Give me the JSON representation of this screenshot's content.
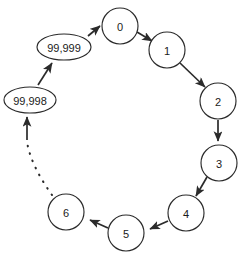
{
  "diagram": {
    "type": "ring-graph",
    "background_color": "#ffffff",
    "stroke_color": "#2b2b2b",
    "fill_color": "#ffffff",
    "nodes": [
      {
        "id": "n0",
        "label": "0",
        "shape": "circle",
        "cx": 120,
        "cy": 26,
        "r": 18
      },
      {
        "id": "n1",
        "label": "1",
        "shape": "circle",
        "cx": 167,
        "cy": 50,
        "r": 18
      },
      {
        "id": "n2",
        "label": "2",
        "shape": "circle",
        "cx": 218,
        "cy": 101,
        "r": 18
      },
      {
        "id": "n3",
        "label": "3",
        "shape": "circle",
        "cx": 219,
        "cy": 163,
        "r": 18
      },
      {
        "id": "n4",
        "label": "4",
        "shape": "circle",
        "cx": 186,
        "cy": 213,
        "r": 18
      },
      {
        "id": "n5",
        "label": "5",
        "shape": "circle",
        "cx": 126,
        "cy": 233,
        "r": 18
      },
      {
        "id": "n6",
        "label": "6",
        "shape": "circle",
        "cx": 66,
        "cy": 212,
        "r": 18
      },
      {
        "id": "n99998",
        "label": "99,998",
        "shape": "ellipse",
        "cx": 30,
        "cy": 100,
        "rx": 26,
        "ry": 13
      },
      {
        "id": "n99999",
        "label": "99,999",
        "shape": "ellipse",
        "cx": 64,
        "cy": 47,
        "rx": 27,
        "ry": 13
      }
    ],
    "edges": [
      {
        "id": "e0",
        "from": "n0",
        "to": "n1",
        "style": "solid",
        "arrow": true
      },
      {
        "id": "e1",
        "from": "n1",
        "to": "n2",
        "style": "solid",
        "arrow": true
      },
      {
        "id": "e2",
        "from": "n2",
        "to": "n3",
        "style": "solid",
        "arrow": true
      },
      {
        "id": "e3",
        "from": "n3",
        "to": "n4",
        "style": "solid",
        "arrow": true
      },
      {
        "id": "e4",
        "from": "n4",
        "to": "n5",
        "style": "solid",
        "arrow": true
      },
      {
        "id": "e5",
        "from": "n5",
        "to": "n6",
        "style": "solid",
        "arrow": true
      },
      {
        "id": "e6",
        "from": "n6",
        "to": "n99998",
        "style": "dashed",
        "arrow": true
      },
      {
        "id": "e7",
        "from": "n99998",
        "to": "n99999",
        "style": "solid",
        "arrow": true
      },
      {
        "id": "e8",
        "from": "n99999",
        "to": "n0",
        "style": "solid",
        "arrow": true
      }
    ]
  }
}
